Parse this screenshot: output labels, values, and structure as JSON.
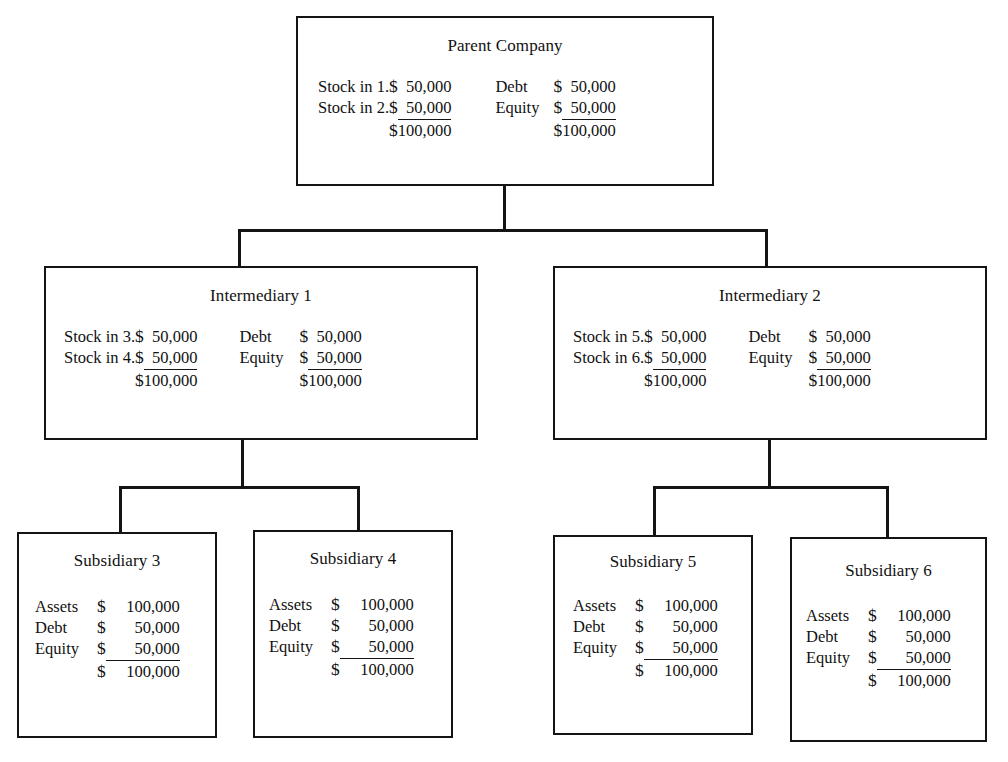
{
  "diagram": {
    "currency_symbol": "$",
    "line_color": "#141414",
    "background": "#ffffff"
  },
  "nodes": {
    "parent": {
      "title": "Parent Company",
      "left_rows": [
        {
          "label": "Stock in 1.",
          "currency": "$",
          "amount": "50,000",
          "ruled": false
        },
        {
          "label": "Stock in 2.",
          "currency": "$",
          "amount": "50,000",
          "ruled": true
        },
        {
          "label": "",
          "currency": "$",
          "amount": "100,000",
          "ruled": false
        }
      ],
      "right_rows": [
        {
          "label": "Debt",
          "currency": "$",
          "amount": "50,000",
          "ruled": false
        },
        {
          "label": "Equity",
          "currency": "$",
          "amount": "50,000",
          "ruled": true
        },
        {
          "label": "",
          "currency": "$",
          "amount": "100,000",
          "ruled": false
        }
      ]
    },
    "intermediary1": {
      "title": "Intermediary 1",
      "left_rows": [
        {
          "label": "Stock in 3.",
          "currency": "$",
          "amount": "50,000",
          "ruled": false
        },
        {
          "label": "Stock in 4.",
          "currency": "$",
          "amount": "50,000",
          "ruled": true
        },
        {
          "label": "",
          "currency": "$",
          "amount": "100,000",
          "ruled": false
        }
      ],
      "right_rows": [
        {
          "label": "Debt",
          "currency": "$",
          "amount": "50,000",
          "ruled": false
        },
        {
          "label": "Equity",
          "currency": "$",
          "amount": "50,000",
          "ruled": true
        },
        {
          "label": "",
          "currency": "$",
          "amount": "100,000",
          "ruled": false
        }
      ]
    },
    "intermediary2": {
      "title": "Intermediary 2",
      "left_rows": [
        {
          "label": "Stock in 5.",
          "currency": "$",
          "amount": "50,000",
          "ruled": false
        },
        {
          "label": "Stock in 6.",
          "currency": "$",
          "amount": "50,000",
          "ruled": true
        },
        {
          "label": "",
          "currency": "$",
          "amount": "100,000",
          "ruled": false
        }
      ],
      "right_rows": [
        {
          "label": "Debt",
          "currency": "$",
          "amount": "50,000",
          "ruled": false
        },
        {
          "label": "Equity",
          "currency": "$",
          "amount": "50,000",
          "ruled": true
        },
        {
          "label": "",
          "currency": "$",
          "amount": "100,000",
          "ruled": false
        }
      ]
    },
    "subsidiary3": {
      "title": "Subsidiary 3",
      "rows": [
        {
          "label": "Assets",
          "currency": "$",
          "amount": "100,000",
          "ruled": false
        },
        {
          "label": "Debt",
          "currency": "$",
          "amount": "50,000",
          "ruled": false
        },
        {
          "label": "Equity",
          "currency": "$",
          "amount": "50,000",
          "ruled": true
        },
        {
          "label": "",
          "currency": "$",
          "amount": "100,000",
          "ruled": false
        }
      ]
    },
    "subsidiary4": {
      "title": "Subsidiary 4",
      "rows": [
        {
          "label": "Assets",
          "currency": "$",
          "amount": "100,000",
          "ruled": false
        },
        {
          "label": "Debt",
          "currency": "$",
          "amount": "50,000",
          "ruled": false
        },
        {
          "label": "Equity",
          "currency": "$",
          "amount": "50,000",
          "ruled": true
        },
        {
          "label": "",
          "currency": "$",
          "amount": "100,000",
          "ruled": false
        }
      ]
    },
    "subsidiary5": {
      "title": "Subsidiary 5",
      "rows": [
        {
          "label": "Assets",
          "currency": "$",
          "amount": "100,000",
          "ruled": false
        },
        {
          "label": "Debt",
          "currency": "$",
          "amount": "50,000",
          "ruled": false
        },
        {
          "label": "Equity",
          "currency": "$",
          "amount": "50,000",
          "ruled": true
        },
        {
          "label": "",
          "currency": "$",
          "amount": "100,000",
          "ruled": false
        }
      ]
    },
    "subsidiary6": {
      "title": "Subsidiary 6",
      "rows": [
        {
          "label": "Assets",
          "currency": "$",
          "amount": "100,000",
          "ruled": false
        },
        {
          "label": "Debt",
          "currency": "$",
          "amount": "50,000",
          "ruled": false
        },
        {
          "label": "Equity",
          "currency": "$",
          "amount": "50,000",
          "ruled": true
        },
        {
          "label": "",
          "currency": "$",
          "amount": "100,000",
          "ruled": false
        }
      ]
    }
  }
}
